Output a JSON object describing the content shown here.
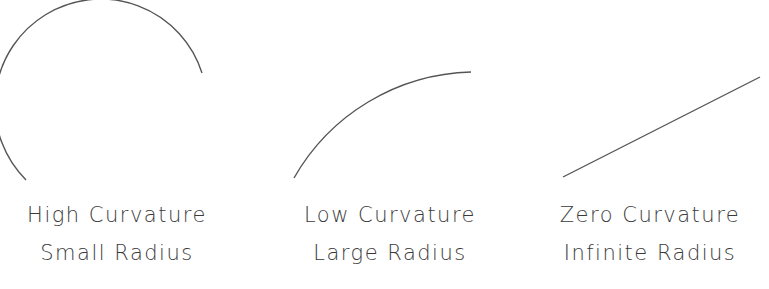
{
  "diagram": {
    "stroke_color": "#555555",
    "panels": [
      {
        "id": "high-curvature",
        "shape": "arc",
        "caption_line1": "High Curvature",
        "caption_line2": "Small Radius"
      },
      {
        "id": "low-curvature",
        "shape": "arc",
        "caption_line1": "Low Curvature",
        "caption_line2": "Large Radius"
      },
      {
        "id": "zero-curvature",
        "shape": "line",
        "caption_line1": "Zero Curvature",
        "caption_line2": "Infinite Radius"
      }
    ]
  }
}
